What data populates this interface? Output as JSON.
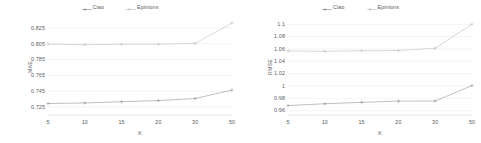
{
  "figure": {
    "panels": [
      "left",
      "right"
    ]
  },
  "legend": {
    "items": [
      {
        "label": "Ciao",
        "color": "#8b8b8b",
        "marker": "plus"
      },
      {
        "label": "Epinions",
        "color": "#b9b9b9",
        "marker": "plus"
      }
    ]
  },
  "chart_data": [
    {
      "type": "line",
      "title": "",
      "xlabel": "K",
      "ylabel": "MAE",
      "categories": [
        "5",
        "10",
        "15",
        "20",
        "30",
        "50"
      ],
      "x": [
        5,
        10,
        15,
        20,
        30,
        50
      ],
      "yticks": [
        "0.825",
        "0.805",
        "0.785",
        "0.765",
        "0.745",
        "0.725"
      ],
      "ytick_values": [
        0.825,
        0.805,
        0.785,
        0.765,
        0.745,
        0.725
      ],
      "ylim": [
        0.715,
        0.835
      ],
      "grid": true,
      "legend_position": "top-center",
      "series": [
        {
          "name": "Ciao",
          "color": "#8b8b8b",
          "values": [
            0.7295,
            0.7302,
            0.7318,
            0.7332,
            0.7358,
            0.7465
          ]
        },
        {
          "name": "Epinions",
          "color": "#b9b9b9",
          "values": [
            0.8045,
            0.8038,
            0.8043,
            0.8044,
            0.8055,
            0.8312
          ]
        }
      ]
    },
    {
      "type": "line",
      "title": "",
      "xlabel": "K",
      "ylabel": "RMSE",
      "categories": [
        "5",
        "10",
        "15",
        "20",
        "30",
        "50"
      ],
      "x": [
        5,
        10,
        15,
        20,
        30,
        50
      ],
      "yticks": [
        "1.1",
        "1.08",
        "1.06",
        "1.04",
        "1.02",
        "1",
        "0.98",
        "0.96"
      ],
      "ytick_values": [
        1.1,
        1.08,
        1.06,
        1.04,
        1.02,
        1.0,
        0.98,
        0.96
      ],
      "ylim": [
        0.953,
        1.107
      ],
      "grid": true,
      "legend_position": "top-center",
      "series": [
        {
          "name": "Ciao",
          "color": "#8b8b8b",
          "values": [
            0.9683,
            0.9712,
            0.9735,
            0.9755,
            0.9757,
            1.0007
          ]
        },
        {
          "name": "Epinions",
          "color": "#b9b9b9",
          "values": [
            1.0568,
            1.0562,
            1.0572,
            1.0575,
            1.0613,
            1.1003
          ]
        }
      ]
    }
  ]
}
